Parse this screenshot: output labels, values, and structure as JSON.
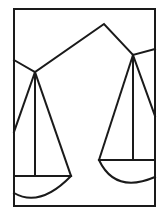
{
  "image": {
    "description": "Line drawing of a balance scale with two hanging pans inside a rectangular frame",
    "icon": "balance-scale-icon",
    "colors": {
      "background": "#ffffff",
      "line": "#1a1a1a"
    }
  }
}
